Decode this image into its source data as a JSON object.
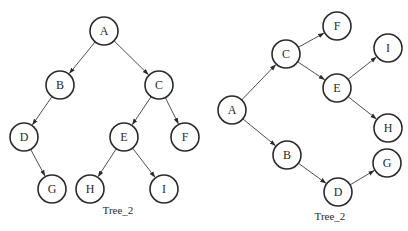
{
  "diagrams": [
    {
      "caption": "Tree_2",
      "caption_pos": [
        118,
        214
      ],
      "nodes": [
        {
          "id": "A",
          "label": "A",
          "x": 104,
          "y": 31
        },
        {
          "id": "B",
          "label": "B",
          "x": 60,
          "y": 85
        },
        {
          "id": "C",
          "label": "C",
          "x": 159,
          "y": 85
        },
        {
          "id": "D",
          "label": "D",
          "x": 24,
          "y": 137
        },
        {
          "id": "E",
          "label": "E",
          "x": 124,
          "y": 137
        },
        {
          "id": "F",
          "label": "F",
          "x": 185,
          "y": 137
        },
        {
          "id": "G",
          "label": "G",
          "x": 52,
          "y": 189
        },
        {
          "id": "H",
          "label": "H",
          "x": 90,
          "y": 189
        },
        {
          "id": "I",
          "label": "I",
          "x": 164,
          "y": 189
        }
      ],
      "edges": [
        [
          "A",
          "B"
        ],
        [
          "A",
          "C"
        ],
        [
          "B",
          "D"
        ],
        [
          "C",
          "E"
        ],
        [
          "C",
          "F"
        ],
        [
          "D",
          "G"
        ],
        [
          "E",
          "H"
        ],
        [
          "E",
          "I"
        ]
      ]
    },
    {
      "caption": "Tree_2",
      "caption_pos": [
        330,
        220
      ],
      "nodes": [
        {
          "id": "A",
          "label": "A",
          "x": 232,
          "y": 110
        },
        {
          "id": "C",
          "label": "C",
          "x": 286,
          "y": 54
        },
        {
          "id": "B",
          "label": "B",
          "x": 287,
          "y": 155
        },
        {
          "id": "F",
          "label": "F",
          "x": 337,
          "y": 26
        },
        {
          "id": "E",
          "label": "E",
          "x": 337,
          "y": 88
        },
        {
          "id": "D",
          "label": "D",
          "x": 338,
          "y": 192
        },
        {
          "id": "I",
          "label": "I",
          "x": 388,
          "y": 48
        },
        {
          "id": "H",
          "label": "H",
          "x": 388,
          "y": 128
        },
        {
          "id": "G",
          "label": "G",
          "x": 387,
          "y": 163
        }
      ],
      "edges": [
        [
          "A",
          "C"
        ],
        [
          "A",
          "B"
        ],
        [
          "C",
          "F"
        ],
        [
          "C",
          "E"
        ],
        [
          "E",
          "I"
        ],
        [
          "E",
          "H"
        ],
        [
          "B",
          "D"
        ],
        [
          "D",
          "G"
        ]
      ]
    }
  ],
  "node_radius": 14
}
